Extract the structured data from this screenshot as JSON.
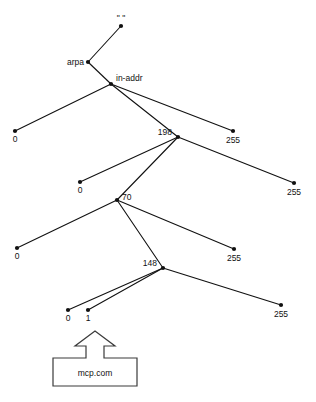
{
  "diagram": {
    "colors": {
      "background": "#ffffff",
      "edge": "#111111",
      "node": "#111111",
      "text": "#111111",
      "callout_stroke": "#3a3a3a",
      "callout_fill": "#ffffff"
    },
    "nodes": [
      {
        "id": "root",
        "label": "\" \"",
        "x": 121,
        "y": 26,
        "anchor": "mid",
        "label_dx": 0,
        "label_dy": -5
      },
      {
        "id": "arpa",
        "label": "arpa",
        "x": 88,
        "y": 62,
        "anchor": "end",
        "label_dx": -4,
        "label_dy": 3
      },
      {
        "id": "in-addr",
        "label": "in-addr",
        "x": 111,
        "y": 84,
        "anchor": "start",
        "label_dx": 5,
        "label_dy": -3
      },
      {
        "id": "l1-0",
        "label": "0",
        "x": 15,
        "y": 131,
        "anchor": "mid",
        "label_dx": 0,
        "label_dy": 11
      },
      {
        "id": "n198",
        "label": "198",
        "x": 178,
        "y": 137,
        "anchor": "end",
        "label_dx": -6,
        "label_dy": -2
      },
      {
        "id": "l1-255",
        "label": "255",
        "x": 233,
        "y": 131,
        "anchor": "mid",
        "label_dx": 0,
        "label_dy": 12
      },
      {
        "id": "l2-0",
        "label": "0",
        "x": 80,
        "y": 182,
        "anchor": "mid",
        "label_dx": 0,
        "label_dy": 11
      },
      {
        "id": "n70",
        "label": "70",
        "x": 117,
        "y": 200,
        "anchor": "start",
        "label_dx": 5,
        "label_dy": 0
      },
      {
        "id": "l2-255",
        "label": "255",
        "x": 294,
        "y": 183,
        "anchor": "mid",
        "label_dx": 0,
        "label_dy": 12
      },
      {
        "id": "l3-0",
        "label": "0",
        "x": 17,
        "y": 248,
        "anchor": "mid",
        "label_dx": 0,
        "label_dy": 11
      },
      {
        "id": "n148",
        "label": "148",
        "x": 163,
        "y": 268,
        "anchor": "end",
        "label_dx": -6,
        "label_dy": -2
      },
      {
        "id": "l3-255",
        "label": "255",
        "x": 234,
        "y": 249,
        "anchor": "mid",
        "label_dx": 0,
        "label_dy": 12
      },
      {
        "id": "l4-0",
        "label": "0",
        "x": 68,
        "y": 310,
        "anchor": "mid",
        "label_dx": 0,
        "label_dy": 11
      },
      {
        "id": "l4-1",
        "label": "1",
        "x": 88,
        "y": 310,
        "anchor": "mid",
        "label_dx": 0,
        "label_dy": 11
      },
      {
        "id": "l4-255",
        "label": "255",
        "x": 281,
        "y": 305,
        "anchor": "mid",
        "label_dx": 0,
        "label_dy": 12
      }
    ],
    "edges": [
      {
        "from": "root",
        "to": "arpa"
      },
      {
        "from": "arpa",
        "to": "in-addr"
      },
      {
        "from": "in-addr",
        "to": "l1-0"
      },
      {
        "from": "in-addr",
        "to": "n198"
      },
      {
        "from": "in-addr",
        "to": "l1-255"
      },
      {
        "from": "n198",
        "to": "l2-0"
      },
      {
        "from": "n198",
        "to": "n70"
      },
      {
        "from": "n198",
        "to": "l2-255"
      },
      {
        "from": "n70",
        "to": "l3-0"
      },
      {
        "from": "n70",
        "to": "n148"
      },
      {
        "from": "n70",
        "to": "l3-255"
      },
      {
        "from": "n148",
        "to": "l4-0"
      },
      {
        "from": "n148",
        "to": "l4-1"
      },
      {
        "from": "n148",
        "to": "l4-255"
      }
    ],
    "callout": {
      "label": "mcp.com",
      "box": {
        "x": 53,
        "y": 358,
        "width": 84,
        "height": 28
      },
      "arrow": {
        "tip_x": 95,
        "tip_y": 331,
        "shaft_half_width": 9,
        "head_half_width": 20,
        "head_y": 346
      },
      "text_x": 95,
      "text_y": 376
    }
  }
}
